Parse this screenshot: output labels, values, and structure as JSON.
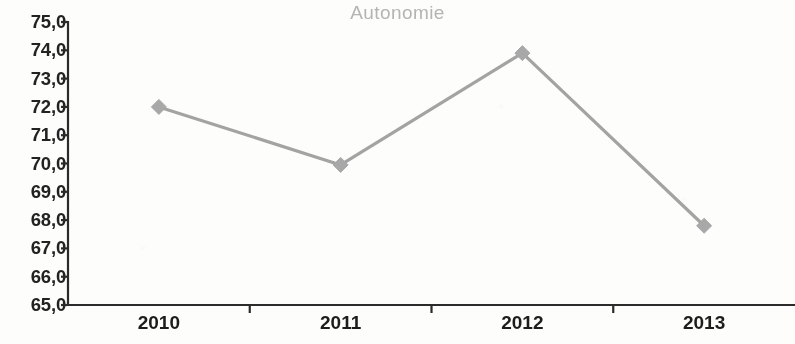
{
  "chart_data": {
    "type": "line",
    "title": "Autonomie",
    "xlabel": "",
    "ylabel": "",
    "categories": [
      "2010",
      "2011",
      "2012",
      "2013"
    ],
    "values": [
      72.0,
      69.95,
      73.9,
      67.8
    ],
    "series": [
      {
        "name": "Autonomie",
        "values": [
          72.0,
          69.95,
          73.9,
          67.8
        ]
      }
    ],
    "ylim": [
      65.0,
      75.0
    ],
    "ytick_step": 1.0,
    "ytick_labels": [
      "75,0",
      "74,0",
      "73,0",
      "72,0",
      "71,0",
      "70,0",
      "69,0",
      "68,0",
      "67,0",
      "66,0",
      "65,0"
    ],
    "ytick_values": [
      75.0,
      74.0,
      73.0,
      72.0,
      71.0,
      70.0,
      69.0,
      68.0,
      67.0,
      66.0,
      65.0
    ],
    "xtick_labels": [
      "2010",
      "2011",
      "2012",
      "2013"
    ],
    "grid": false,
    "legend": false,
    "marker": "diamond",
    "colors": {
      "line": "#a3a3a3",
      "marker": "#a8a8a8",
      "axis": "#2b2b2b",
      "title": "#b4b4b4",
      "tick_text": "#222222",
      "background": "#fdfdfc"
    }
  }
}
